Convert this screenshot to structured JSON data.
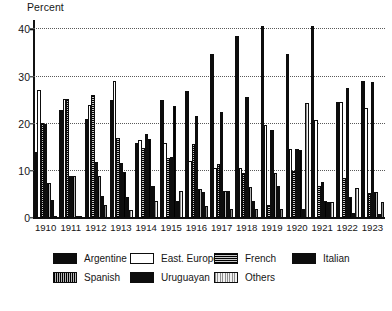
{
  "chart_data": {
    "type": "bar",
    "title": "Percent",
    "xlabel": "",
    "ylabel": "Percent",
    "ylim": [
      0,
      42
    ],
    "yticks": [
      0,
      10,
      20,
      30,
      40
    ],
    "ytick_labels": [
      "0",
      "10",
      "20",
      "30",
      "40"
    ],
    "grid": "horizontal-dotted",
    "legend_position": "bottom",
    "categories": [
      "1910",
      "1911",
      "1912",
      "1913",
      "1914",
      "1915",
      "1916",
      "1917",
      "1918",
      "1919",
      "1920",
      "1921",
      "1922",
      "1923"
    ],
    "series": [
      {
        "name": "Argentine",
        "swatch": "solid-black",
        "values": [
          14.0,
          23.0,
          21.0,
          25.0,
          16.0,
          25.0,
          27.0,
          34.8,
          38.7,
          40.7,
          34.7,
          40.7,
          24.6,
          29.1
        ]
      },
      {
        "name": "East. Europe*",
        "swatch": "white-outline",
        "values": [
          27.2,
          25.2,
          24.0,
          29.0,
          16.6,
          16.0,
          12.1,
          10.7,
          10.7,
          19.8,
          14.6,
          20.7,
          24.7,
          23.3
        ]
      },
      {
        "name": "French",
        "swatch": "dark-horizontal-hatch",
        "values": [
          20.1,
          25.2,
          26.0,
          16.9,
          14.9,
          12.7,
          15.8,
          11.5,
          9.6,
          2.7,
          9.9,
          6.7,
          8.5,
          5.4
        ]
      },
      {
        "name": "Italian",
        "swatch": "solid-black",
        "values": [
          20.0,
          9.0,
          11.9,
          11.6,
          17.9,
          13.0,
          21.7,
          22.5,
          25.6,
          18.6,
          14.6,
          7.6,
          27.6,
          28.9
        ]
      },
      {
        "name": "Spanish",
        "swatch": "dark-vertical-hatch",
        "values": [
          7.5,
          8.9,
          9.0,
          9.8,
          16.8,
          23.8,
          6.1,
          5.8,
          6.5,
          9.5,
          14.5,
          3.6,
          4.4,
          5.5
        ]
      },
      {
        "name": "Uruguayan",
        "swatch": "solid-black",
        "values": [
          3.9,
          0.2,
          4.7,
          4.4,
          6.7,
          3.6,
          5.5,
          5.7,
          3.6,
          6.7,
          2.0,
          3.5,
          1.0,
          0.8
        ]
      },
      {
        "name": "Others",
        "swatch": "light-vertical-hatch",
        "values": [
          0.2,
          0.2,
          2.8,
          1.8,
          3.6,
          5.8,
          2.6,
          2.0,
          2.0,
          2.0,
          24.5,
          3.4,
          6.4,
          3.3
        ]
      }
    ]
  },
  "legend": {
    "rows": [
      [
        {
          "label": "Argentine",
          "swatch": "solid-black",
          "x": 53
        },
        {
          "label": "East. Europe*",
          "swatch": "white-outline",
          "x": 130
        },
        {
          "label": "French",
          "swatch": "dark-horizontal-hatch",
          "x": 214
        },
        {
          "label": "Italian",
          "swatch": "solid-black",
          "x": 292
        }
      ],
      [
        {
          "label": "Spanish",
          "swatch": "dark-vertical-hatch",
          "x": 53
        },
        {
          "label": "Uruguayan",
          "swatch": "solid-black",
          "x": 130
        },
        {
          "label": "Others",
          "swatch": "light-vertical-hatch",
          "x": 214
        }
      ]
    ]
  },
  "colors": {
    "axis": "#111111",
    "grid": "#5a5a5a",
    "bar_dark": "#0d0d0d",
    "bar_light": "#dcdcdc",
    "background": "#ffffff"
  }
}
